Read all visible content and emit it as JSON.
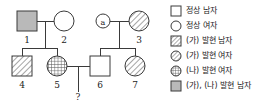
{
  "diagram": {
    "type": "pedigree-chart",
    "unknown_offspring_label": "?",
    "individuals": [
      {
        "id": "a",
        "label": "ⓐ",
        "sex": "female",
        "shape": "circle",
        "fill": "open",
        "generation": 1,
        "marker": "a"
      },
      {
        "id": "1",
        "label": "1",
        "sex": "male",
        "shape": "square",
        "fill": "solid-gray",
        "generation": 1
      },
      {
        "id": "2",
        "label": "2",
        "sex": "female",
        "shape": "circle",
        "fill": "open",
        "generation": 1
      },
      {
        "id": "3",
        "label": "3",
        "sex": "female",
        "shape": "circle",
        "fill": "diagonal",
        "generation": 1
      },
      {
        "id": "4",
        "label": "4",
        "sex": "male",
        "shape": "square",
        "fill": "diagonal",
        "generation": 2
      },
      {
        "id": "5",
        "label": "5",
        "sex": "female",
        "shape": "circle",
        "fill": "grid",
        "generation": 2
      },
      {
        "id": "6",
        "label": "6",
        "sex": "male",
        "shape": "square",
        "fill": "open",
        "generation": 2
      },
      {
        "id": "7",
        "label": "7",
        "sex": "female",
        "shape": "circle",
        "fill": "diagonal",
        "generation": 2
      }
    ],
    "matings": [
      {
        "partners": [
          "1",
          "2"
        ],
        "children": [
          "4",
          "5"
        ]
      },
      {
        "partners": [
          "a",
          "3"
        ],
        "children": [
          "6",
          "7"
        ]
      },
      {
        "partners": [
          "5",
          "6"
        ],
        "children": [
          "?"
        ]
      }
    ]
  },
  "legend": {
    "items": [
      {
        "symbol": "square-open",
        "label": "정상 남자"
      },
      {
        "symbol": "circle-open",
        "label": "정상 여자"
      },
      {
        "symbol": "square-diagonal",
        "label": "(가) 발현 남자"
      },
      {
        "symbol": "circle-diagonal",
        "label": "(가) 발현 여자"
      },
      {
        "symbol": "circle-grid",
        "label": "(나) 발현 여자"
      },
      {
        "symbol": "square-gray",
        "label": "(가), (나) 발현 남자"
      }
    ]
  },
  "colors": {
    "line": "#3a3a3a",
    "text": "#1c1c1c",
    "gray_fill": "#b9b9b9",
    "hatch": "#555555",
    "background": "#ffffff"
  }
}
